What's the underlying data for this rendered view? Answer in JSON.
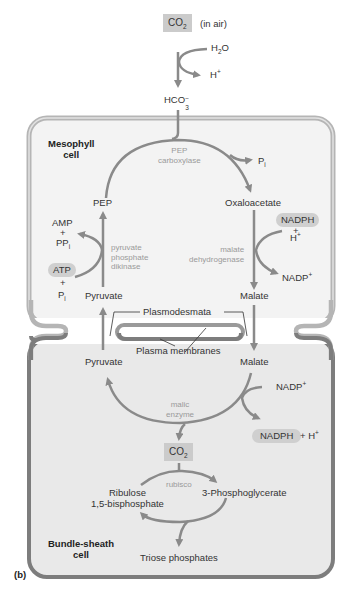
{
  "figure_label": "(b)",
  "colors": {
    "arrow": "#8a8a8a",
    "mesophyll_fill": "#f3f3f3",
    "mesophyll_border": "#b5b5b5",
    "bundle_fill": "#e9e9e9",
    "bundle_border": "#7d7d7d",
    "highlight_pill": "#cfcfcf",
    "enzyme_text": "#9a9a9a"
  },
  "top": {
    "co2_box": {
      "main": "CO",
      "sub": "2"
    },
    "in_air": "(in air)",
    "h2o": {
      "main": "H",
      "sub": "2",
      "tail": "O"
    },
    "h_plus": {
      "main": "H",
      "sup": "+"
    },
    "hco3": {
      "main": "HCO",
      "sub": "3",
      "sup": "−"
    }
  },
  "mesophyll": {
    "title_line1": "Mesophyll",
    "title_line2": "cell",
    "pep": "PEP",
    "pep_carboxylase_line1": "PEP",
    "pep_carboxylase_line2": "carboxylase",
    "pi_out": {
      "main": "P",
      "sub": "i"
    },
    "oxaloacetate": "Oxaloacetate",
    "nadph": "NADPH",
    "plus": "+",
    "h_plus": {
      "main": "H",
      "sup": "+"
    },
    "malate_dehydrogenase_line1": "malate",
    "malate_dehydrogenase_line2": "dehydrogenase",
    "nadp_plus": {
      "main": "NADP",
      "sup": "+"
    },
    "malate": "Malate",
    "amp": "AMP",
    "ppi": {
      "main": "PP",
      "sub": "i"
    },
    "atp": "ATP",
    "pi_in": {
      "main": "P",
      "sub": "i"
    },
    "ppdk_line1": "pyruvate",
    "ppdk_line2": "phosphate",
    "ppdk_line3": "dikinase",
    "pyruvate": "Pyruvate"
  },
  "junction": {
    "plasmodesmata": "Plasmodesmata",
    "plasma_membranes": "Plasma membranes"
  },
  "bundle_sheath": {
    "title_line1": "Bundle-sheath",
    "title_line2": "cell",
    "pyruvate": "Pyruvate",
    "malate": "Malate",
    "nadp_plus": {
      "main": "NADP",
      "sup": "+"
    },
    "malic_enzyme_line1": "malic",
    "malic_enzyme_line2": "enzyme",
    "nadph": "NADPH",
    "h_plus_tail": {
      "main": "+ H",
      "sup": "+"
    },
    "co2_box": {
      "main": "CO",
      "sub": "2"
    },
    "rubisco": "rubisco",
    "ribulose_line1": "Ribulose",
    "ribulose_line2": "1,5-bisphosphate",
    "pga": "3-Phosphoglycerate",
    "triose": "Triose phosphates"
  }
}
